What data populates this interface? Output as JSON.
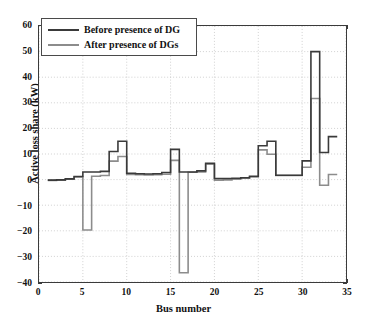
{
  "chart_data": {
    "type": "line",
    "title": "",
    "xlabel": "Bus number",
    "ylabel": "Active loss share (kW)",
    "xlim": [
      0,
      35
    ],
    "ylim": [
      -40,
      60
    ],
    "xticks": [
      0,
      5,
      10,
      15,
      20,
      25,
      30,
      35
    ],
    "yticks": [
      -40,
      -30,
      -20,
      -10,
      0,
      10,
      20,
      30,
      40,
      50,
      60
    ],
    "grid": true,
    "legend_position": "upper-left",
    "style": "step",
    "colors": {
      "before": "#3a3a3a",
      "after": "#8c8c8c",
      "axis": "#3b3b3b",
      "grid": "#bdbdbd",
      "background": "#ffffff"
    },
    "x": [
      1,
      2,
      3,
      4,
      5,
      6,
      7,
      8,
      9,
      10,
      11,
      12,
      13,
      14,
      15,
      16,
      17,
      18,
      19,
      20,
      21,
      22,
      23,
      24,
      25,
      26,
      27,
      28,
      29,
      30,
      31,
      32,
      33
    ],
    "series": [
      {
        "name": "Before presence of DG",
        "color": "#3a3a3a",
        "values": [
          -0.2,
          -0.1,
          0.3,
          1.2,
          3.0,
          3.0,
          3.2,
          11.0,
          15.0,
          2.5,
          2.3,
          2.2,
          2.3,
          2.8,
          11.8,
          3.0,
          3.0,
          3.4,
          6.4,
          0.4,
          0.4,
          0.5,
          0.7,
          1.3,
          13.2,
          15.0,
          1.7,
          1.7,
          1.7,
          7.3,
          50.0,
          10.6,
          16.8
        ]
      },
      {
        "name": "After presence of DGs",
        "color": "#8c8c8c",
        "values": [
          -0.3,
          -0.2,
          0.2,
          1.0,
          -19.7,
          1.3,
          1.6,
          7.2,
          9.0,
          2.0,
          1.9,
          1.8,
          1.9,
          2.1,
          7.5,
          -36.4,
          2.9,
          3.0,
          6.0,
          -0.2,
          -0.1,
          0.2,
          0.5,
          1.0,
          11.6,
          9.9,
          1.6,
          1.6,
          1.6,
          4.8,
          31.7,
          -2.2,
          2.0
        ]
      }
    ]
  },
  "legend": {
    "items": [
      {
        "label": "Before presence of DG"
      },
      {
        "label": "After presence of DGs"
      }
    ]
  },
  "axes": {
    "ylabel": "Active loss share (kW)",
    "xlabel": "Bus number",
    "ytick_labels": [
      "60",
      "50",
      "40",
      "30",
      "20",
      "10",
      "0",
      "−10",
      "−20",
      "−30",
      "−40"
    ],
    "xtick_labels": [
      "0",
      "5",
      "10",
      "15",
      "20",
      "25",
      "30",
      "35"
    ]
  }
}
